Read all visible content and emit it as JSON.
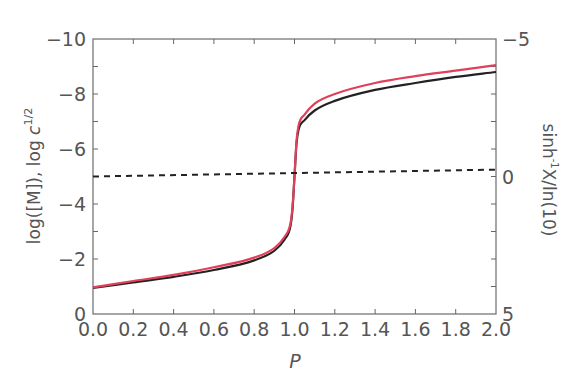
{
  "chart_data": {
    "type": "line",
    "title": "",
    "xlabel": "P",
    "ylabel": "log([M]), log c^1/2",
    "ylabel_parts": {
      "main": "log([M]), log ",
      "italic": "c",
      "sup": "1/2"
    },
    "y2label": "sinh⁻¹X/ln(10)",
    "y2label_parts": {
      "main": "sinh",
      "sup": "-1",
      "rest": "X/ln(10)"
    },
    "xlim": [
      0.0,
      2.0
    ],
    "ylim": [
      0,
      -10
    ],
    "y2lim": [
      5,
      -5
    ],
    "x_ticks": [
      "0.0",
      "0.2",
      "0.4",
      "0.6",
      "0.8",
      "1.0",
      "1.2",
      "1.4",
      "1.6",
      "1.8",
      "2.0"
    ],
    "y_ticks": [
      "0",
      "-2",
      "-4",
      "-6",
      "-8",
      "-10"
    ],
    "y2_ticks": [
      "5",
      "0",
      "-5"
    ],
    "grid": false,
    "legend": null,
    "series": [
      {
        "name": "log([M])",
        "color": "#222222",
        "style": "solid",
        "x": [
          0.0,
          0.2,
          0.4,
          0.6,
          0.8,
          0.9,
          0.95,
          0.98,
          0.99,
          1.0,
          1.01,
          1.02,
          1.05,
          1.1,
          1.2,
          1.4,
          1.6,
          1.8,
          2.0
        ],
        "y": [
          -0.95,
          -1.15,
          -1.35,
          -1.6,
          -1.95,
          -2.3,
          -2.7,
          -3.2,
          -3.8,
          -5.0,
          -6.2,
          -6.7,
          -7.05,
          -7.4,
          -7.75,
          -8.15,
          -8.4,
          -8.62,
          -8.8
        ]
      },
      {
        "name": "log c^1/2",
        "color": "#e0405a",
        "style": "solid",
        "x": [
          0.0,
          0.2,
          0.4,
          0.6,
          0.8,
          0.9,
          0.95,
          0.98,
          0.99,
          1.0,
          1.01,
          1.02,
          1.05,
          1.1,
          1.2,
          1.4,
          1.6,
          1.8,
          2.0
        ],
        "y": [
          -0.97,
          -1.2,
          -1.42,
          -1.7,
          -2.05,
          -2.4,
          -2.8,
          -3.3,
          -3.9,
          -5.0,
          -6.3,
          -6.85,
          -7.25,
          -7.65,
          -8.0,
          -8.4,
          -8.65,
          -8.85,
          -9.05
        ]
      },
      {
        "name": "sinh⁻¹X/ln(10)",
        "color": "#222222",
        "style": "dashed",
        "axis": "right",
        "x": [
          0.0,
          2.0
        ],
        "y": [
          -5.0,
          -5.25
        ],
        "y2": [
          0.0,
          -0.25
        ]
      }
    ]
  }
}
